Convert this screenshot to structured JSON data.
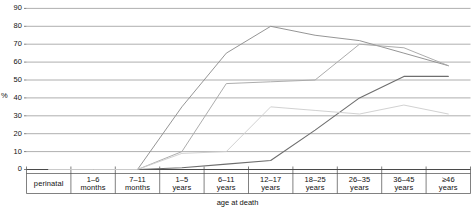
{
  "chart_data": {
    "type": "line",
    "title": "",
    "xlabel": "age at death",
    "ylabel": "%",
    "ylim": [
      0,
      95
    ],
    "grid": true,
    "legend": "none",
    "categories": [
      "perinatal",
      "1–6 months",
      "7–11 months",
      "1–5 years",
      "6–11 years",
      "12–17 years",
      "18–25 years",
      "26–35 years",
      "36–45 years",
      "≥46 years"
    ],
    "yticks": [
      0,
      10,
      20,
      30,
      40,
      50,
      60,
      70,
      80,
      90
    ],
    "xticks": [
      "perinatal",
      "1–6 months",
      "7–11 months",
      "1–5 years",
      "6–11 years",
      "12–17 years",
      "18–25 years",
      "26–35 years",
      "36–45 years",
      "≥46 years"
    ],
    "series": [
      {
        "name": "series-1",
        "color": "#8f8f8f",
        "values": [
          0,
          0,
          0,
          35,
          65,
          80,
          75,
          72,
          65,
          58
        ]
      },
      {
        "name": "series-2",
        "color": "#a8a8a8",
        "values": [
          0,
          0,
          0,
          10,
          48,
          49,
          50,
          70,
          68,
          58
        ]
      },
      {
        "name": "series-3",
        "color": "#6e6e6e",
        "values": [
          0,
          0,
          0,
          1,
          3,
          5,
          22,
          40,
          52,
          52
        ]
      },
      {
        "name": "series-4",
        "color": "#cfcfcf",
        "values": [
          0,
          0,
          0,
          9,
          10,
          35,
          33,
          31,
          36,
          31
        ]
      }
    ]
  },
  "axes": {
    "ylabel_text": "%",
    "xlabel_text": "age at death",
    "ytick_labels": [
      "90",
      "80",
      "70",
      "60",
      "50",
      "40",
      "30",
      "20",
      "10",
      "0"
    ],
    "xtick_lines": [
      [
        "perinatal",
        ""
      ],
      [
        "1–6",
        "months"
      ],
      [
        "7–11",
        "months"
      ],
      [
        "1–5",
        "years"
      ],
      [
        "6–11",
        "years"
      ],
      [
        "12–17",
        "years"
      ],
      [
        "18–25",
        "years"
      ],
      [
        "26–35",
        "years"
      ],
      [
        "36–45",
        "years"
      ],
      [
        "≥46",
        "years"
      ]
    ]
  },
  "style": {
    "grid_color": "#9a9a9a",
    "axis_color": "#4a4a4a",
    "background": "#ffffff"
  }
}
